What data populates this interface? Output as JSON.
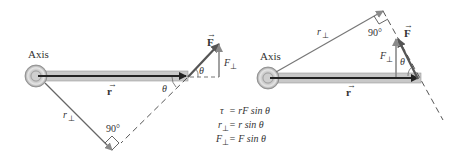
{
  "left_diagram": {
    "axis_label": "Axis",
    "r_vector_label": "r",
    "force_label": "F",
    "r_perp_label": "r",
    "perp_sub": "⊥",
    "f_perp_label": "F",
    "theta_label_1": "θ",
    "theta_label_2": "θ",
    "right_angle_label": "90°"
  },
  "right_diagram": {
    "axis_label": "Axis",
    "r_vector_label": "r",
    "force_label": "F",
    "r_perp_label": "r",
    "perp_sub": "⊥",
    "f_perp_label": "F",
    "theta_label": "θ",
    "right_angle_label": "90°"
  },
  "equations": [
    {
      "lhs": "τ",
      "rhs": "= rF sin θ"
    },
    {
      "lhs": "r",
      "sub": "⊥",
      "rhs": "= r sin θ"
    },
    {
      "lhs": "F",
      "sub": "⊥",
      "rhs": "= F sin θ"
    }
  ],
  "colors": {
    "rod_fill": "#c8c8c8",
    "arrow_dark": "#222222",
    "arrow_gray": "#8a8a8a",
    "line_gray": "#777777"
  }
}
